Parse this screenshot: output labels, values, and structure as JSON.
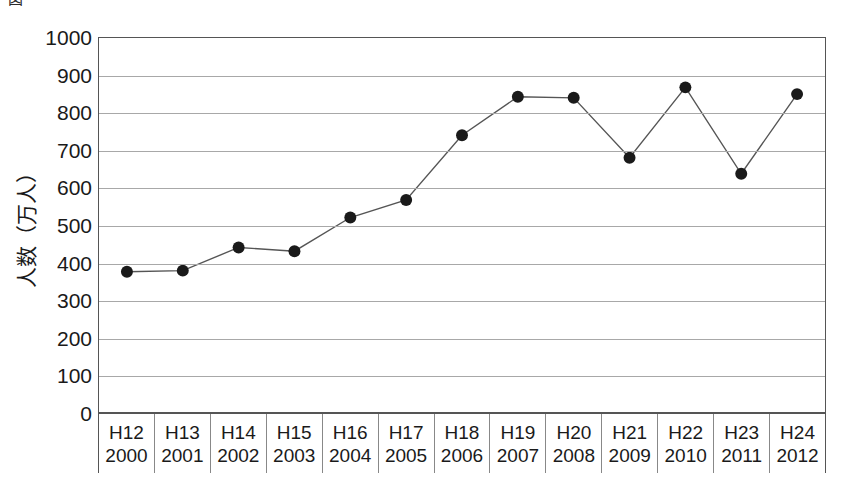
{
  "figure": {
    "caption": "図　　　　　　　　　　　　　　",
    "y_axis_title": "人数（万人）"
  },
  "chart_data": {
    "type": "line",
    "title": "",
    "xlabel": "",
    "ylabel": "人数（万人）",
    "ylim": [
      0,
      1000
    ],
    "ytick_step": 100,
    "grid": true,
    "legend": "none",
    "marker": "filled-circle",
    "line_color": "#555555",
    "marker_color": "#1a1a1a",
    "ytick_labels": [
      "1000",
      "900",
      "800",
      "700",
      "600",
      "500",
      "400",
      "300",
      "200",
      "100",
      "0"
    ],
    "ytick_values": [
      1000,
      900,
      800,
      700,
      600,
      500,
      400,
      300,
      200,
      100,
      0
    ],
    "categories": [
      "H12\n2000",
      "H13\n2001",
      "H14\n2002",
      "H15\n2003",
      "H16\n2004",
      "H17\n2005",
      "H18\n2006",
      "H19\n2007",
      "H20\n2008",
      "H21\n2009",
      "H22\n2010",
      "H23\n2011",
      "H24\n2012"
    ],
    "category_eras": [
      "H12",
      "H13",
      "H14",
      "H15",
      "H16",
      "H17",
      "H18",
      "H19",
      "H20",
      "H21",
      "H22",
      "H23",
      "H24"
    ],
    "category_years": [
      "2000",
      "2001",
      "2002",
      "2003",
      "2004",
      "2005",
      "2006",
      "2007",
      "2008",
      "2009",
      "2010",
      "2011",
      "2012"
    ],
    "values": [
      375,
      378,
      440,
      430,
      520,
      567,
      740,
      843,
      840,
      680,
      868,
      637,
      850
    ]
  }
}
